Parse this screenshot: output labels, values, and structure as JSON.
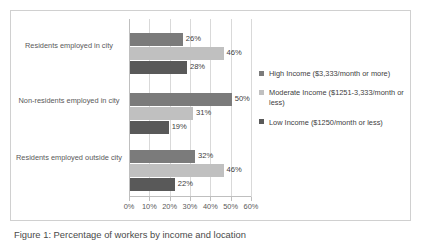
{
  "chart_data": {
    "type": "bar",
    "orientation": "horizontal",
    "title": "",
    "xlabel": "",
    "ylabel": "",
    "xlim": [
      0,
      60
    ],
    "grid": true,
    "legend_position": "right",
    "categories": [
      "Residents employed in city",
      "Non-residents employed in city",
      "Residents employed outside city"
    ],
    "xticks": [
      "0%",
      "10%",
      "20%",
      "30%",
      "40%",
      "50%",
      "60%"
    ],
    "xtick_values": [
      0,
      10,
      20,
      30,
      40,
      50,
      60
    ],
    "series": [
      {
        "name": "High Income ($3,333/month or more)",
        "color": "#7b7b7b",
        "values": [
          26,
          50,
          32
        ],
        "labels": [
          "26%",
          "50%",
          "32%"
        ]
      },
      {
        "name": "Moderate Income ($1251-3,333/month or less)",
        "color": "#c0c0c0",
        "values": [
          46,
          31,
          46
        ],
        "labels": [
          "46%",
          "31%",
          "46%"
        ]
      },
      {
        "name": "Low Income ($1250/month or less)",
        "color": "#595959",
        "values": [
          28,
          19,
          22
        ],
        "labels": [
          "28%",
          "19%",
          "22%"
        ]
      }
    ]
  },
  "legend": {
    "items": [
      {
        "label": "High Income ($3,333/month or more)",
        "color": "#7b7b7b"
      },
      {
        "label": "Moderate Income ($1251-3,333/month or less)",
        "color": "#c0c0c0"
      },
      {
        "label": "Low Income ($1250/month or less)",
        "color": "#595959"
      }
    ]
  },
  "caption": {
    "text": "Figure 1: Percentage of workers by income and location"
  }
}
